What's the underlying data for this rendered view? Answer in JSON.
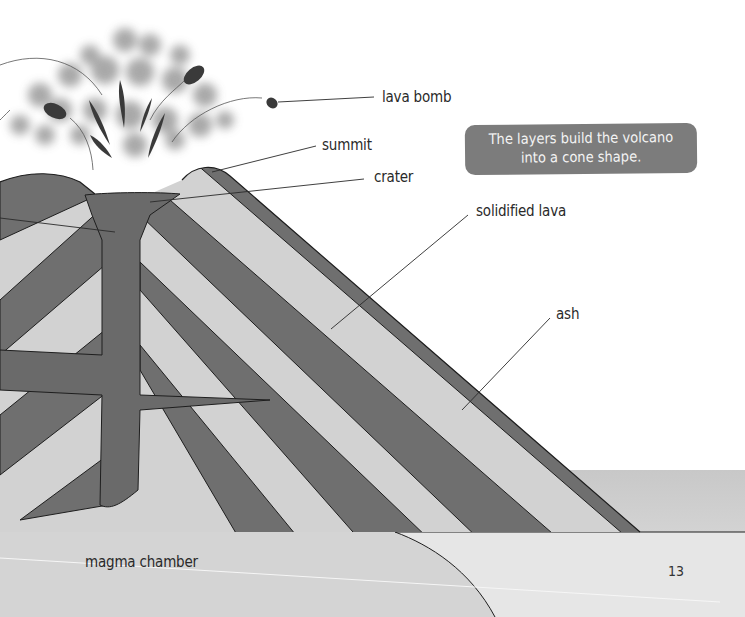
{
  "diagram": {
    "type": "labeled cross-section illustration",
    "colors": {
      "lava_layer": "#6f6f6f",
      "ash_layer": "#d2d2d2",
      "ground": "#d9d9d9",
      "callout_bg": "#7c7c7c",
      "callout_text": "#f4f4f4",
      "outline": "#1e1e1e"
    }
  },
  "labels": {
    "lava_bomb": "lava bomb",
    "summit": "summit",
    "crater": "crater",
    "solidified_lava": "solidified lava",
    "ash": "ash",
    "magma_chamber": "magma chamber"
  },
  "callout": {
    "line1": "The layers build the volcano",
    "line2": "into a cone shape."
  },
  "page_number": "13"
}
